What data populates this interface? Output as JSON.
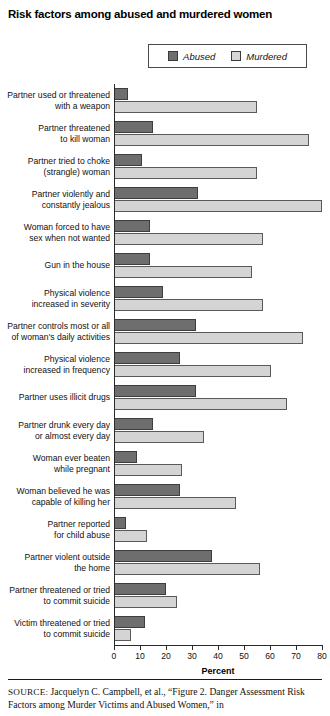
{
  "title": "Risk factors among abused and murdered women",
  "legend": {
    "position": "top-right",
    "items": [
      {
        "label": "Abused",
        "color": "#6e6e6e",
        "icon": "legend-swatch-abused"
      },
      {
        "label": "Murdered",
        "color": "#d4d4d4",
        "icon": "legend-swatch-murdered"
      }
    ]
  },
  "axis": {
    "title": "Percent",
    "ticks": [
      0,
      10,
      20,
      30,
      40,
      50,
      60,
      70,
      80
    ]
  },
  "source": {
    "keyword": "SOURCE:",
    "text": " Jacquelyn C. Campbell, et al., “Figure 2. Danger Assessment Risk Factors among Murder Victims and Abused Women,” in"
  },
  "chart_data": {
    "type": "bar",
    "orientation": "horizontal",
    "title": "Risk factors among abused and murdered women",
    "xlabel": "Percent",
    "ylabel": "",
    "xlim": [
      0,
      80
    ],
    "grid": false,
    "legend_position": "top-right",
    "categories": [
      "Partner used or threatened with a weapon",
      "Partner threatened to kill woman",
      "Partner tried to choke (strangle) woman",
      "Partner violently and constantly jealous",
      "Woman forced to have sex when not wanted",
      "Gun in the house",
      "Physical violence increased in severity",
      "Partner controls most or all of woman's daily activities",
      "Physical violence increased in frequency",
      "Partner uses illicit drugs",
      "Partner drunk every day or almost every day",
      "Woman ever beaten while pregnant",
      "Woman believed he was capable of killing her",
      "Partner reported for child abuse",
      "Partner violent outside the home",
      "Partner threatened or tried to commit suicide",
      "Victim threatened or tried to commit suicide"
    ],
    "category_lines": [
      [
        "Partner used or threatened",
        "with a weapon"
      ],
      [
        "Partner threatened",
        "to kill woman"
      ],
      [
        "Partner tried to choke",
        "(strangle) woman"
      ],
      [
        "Partner violently and",
        "constantly jealous"
      ],
      [
        "Woman forced to have",
        "sex when not wanted"
      ],
      [
        "Gun in the house"
      ],
      [
        "Physical violence",
        "increased in severity"
      ],
      [
        "Partner controls most or all",
        "of woman's daily activities"
      ],
      [
        "Physical violence",
        "increased in frequency"
      ],
      [
        "Partner uses illicit drugs"
      ],
      [
        "Partner drunk every day",
        "or almost every day"
      ],
      [
        "Woman ever beaten",
        "while pregnant"
      ],
      [
        "Woman believed he was",
        "capable of killing her"
      ],
      [
        "Partner reported",
        "for child abuse"
      ],
      [
        "Partner violent outside",
        "the home"
      ],
      [
        "Partner threatened or tried",
        "to commit suicide"
      ],
      [
        "Victim threatened or tried",
        "to commit suicide"
      ]
    ],
    "series": [
      {
        "name": "Abused",
        "color": "#6e6e6e",
        "values": [
          5,
          14,
          10,
          31,
          13,
          13,
          18,
          30,
          24,
          30,
          14,
          8,
          24,
          4,
          36,
          19,
          11
        ]
      },
      {
        "name": "Murdered",
        "color": "#d4d4d4",
        "values": [
          53,
          72,
          53,
          77,
          55,
          51,
          55,
          70,
          58,
          64,
          33,
          25,
          45,
          12,
          54,
          23,
          6
        ]
      }
    ]
  }
}
